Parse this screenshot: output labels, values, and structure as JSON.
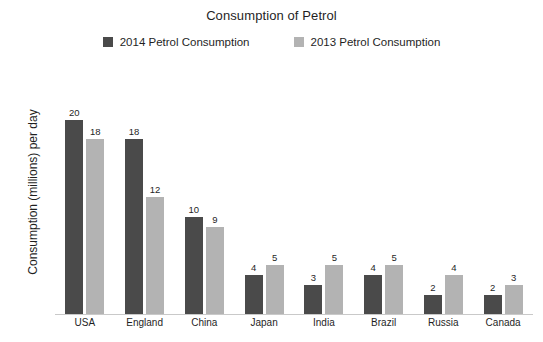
{
  "chart_data": {
    "type": "bar",
    "title": "Consumption of Petrol",
    "xlabel": "",
    "ylabel": "Consumption (millions) per day",
    "categories": [
      "USA",
      "England",
      "China",
      "Japan",
      "India",
      "Brazil",
      "Russia",
      "Canada"
    ],
    "series": [
      {
        "name": "2014 Petrol Consumption",
        "color": "#4a4a4a",
        "values": [
          20,
          18,
          10,
          4,
          3,
          4,
          2,
          2
        ]
      },
      {
        "name": "2013 Petrol Consumption",
        "color": "#b3b3b3",
        "values": [
          18,
          12,
          9,
          5,
          5,
          5,
          4,
          3
        ]
      }
    ],
    "ylim": [
      0,
      24
    ],
    "grid": false,
    "legend_position": "top",
    "data_labels": true,
    "y_axis_ticks_visible": false
  },
  "legend": {
    "items": [
      {
        "label": "2014 Petrol Consumption",
        "swatch_color": "#4a4a4a"
      },
      {
        "label": "2013 Petrol Consumption",
        "swatch_color": "#b3b3b3"
      }
    ]
  },
  "colors": {
    "background": "#ffffff",
    "axis_line": "#c9c9c9",
    "text": "#1f1f1f"
  }
}
